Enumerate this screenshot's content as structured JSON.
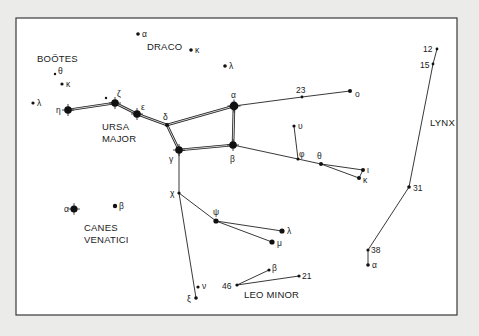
{
  "diagram": {
    "type": "star-chart",
    "frame": {
      "x": 16,
      "y": 18,
      "width": 441,
      "height": 297
    },
    "colors": {
      "background": "#ebebea",
      "panel": "#ffffff",
      "ink": "#111111"
    },
    "constellations": [
      {
        "id": "bootes",
        "label": "BOÖTES",
        "x": 37,
        "y": 62
      },
      {
        "id": "draco",
        "label": "DRACO",
        "x": 147,
        "y": 50
      },
      {
        "id": "ursa-major-1",
        "label": "URSA",
        "x": 102,
        "y": 130
      },
      {
        "id": "ursa-major-2",
        "label": "MAJOR",
        "x": 102,
        "y": 142
      },
      {
        "id": "lynx",
        "label": "LYNX",
        "x": 430,
        "y": 126
      },
      {
        "id": "canes-venatici-1",
        "label": "CANES",
        "x": 84,
        "y": 231
      },
      {
        "id": "canes-venatici-2",
        "label": "VENATICI",
        "x": 84,
        "y": 243
      },
      {
        "id": "leo-minor",
        "label": "LEO MINOR",
        "x": 244,
        "y": 298
      }
    ],
    "stars": [
      {
        "id": "dra-alpha",
        "label": "α",
        "x": 138,
        "y": 34,
        "r": 1.8,
        "lx": 142,
        "ly": 37
      },
      {
        "id": "dra-kappa",
        "label": "κ",
        "x": 191,
        "y": 50,
        "r": 1.8,
        "lx": 195,
        "ly": 53
      },
      {
        "id": "dra-lambda",
        "label": "λ",
        "x": 225,
        "y": 66,
        "r": 1.8,
        "lx": 229,
        "ly": 69
      },
      {
        "id": "boo-theta",
        "label": "θ",
        "x": 55,
        "y": 74,
        "r": 1.2,
        "lx": 58,
        "ly": 74
      },
      {
        "id": "boo-kappa",
        "label": "κ",
        "x": 62,
        "y": 84,
        "r": 1.6,
        "lx": 66,
        "ly": 87
      },
      {
        "id": "boo-lambda",
        "label": "λ",
        "x": 33,
        "y": 103,
        "r": 1.6,
        "lx": 37,
        "ly": 106
      },
      {
        "id": "uma-eta",
        "label": "η",
        "x": 68,
        "y": 110,
        "r": 3.8,
        "lx": 56,
        "ly": 113
      },
      {
        "id": "uma-80",
        "label": "",
        "x": 106,
        "y": 98,
        "r": 1.2,
        "lx": 0,
        "ly": 0
      },
      {
        "id": "uma-zeta",
        "label": "ζ",
        "x": 115,
        "y": 103,
        "r": 3.8,
        "lx": 117,
        "ly": 97
      },
      {
        "id": "uma-epsilon",
        "label": "ε",
        "x": 137,
        "y": 114,
        "r": 3.8,
        "lx": 141,
        "ly": 110
      },
      {
        "id": "uma-delta",
        "label": "δ",
        "x": 167,
        "y": 125,
        "r": 2.0,
        "lx": 163,
        "ly": 120
      },
      {
        "id": "uma-alpha",
        "label": "α",
        "x": 234,
        "y": 106,
        "r": 4.4,
        "lx": 231,
        "ly": 98
      },
      {
        "id": "uma-beta",
        "label": "β",
        "x": 233,
        "y": 145,
        "r": 3.8,
        "lx": 230,
        "ly": 162
      },
      {
        "id": "uma-gamma",
        "label": "γ",
        "x": 179,
        "y": 150,
        "r": 3.8,
        "lx": 169,
        "ly": 162
      },
      {
        "id": "uma-23",
        "label": "23",
        "x": 302,
        "y": 97,
        "r": 1.4,
        "lx": 296,
        "ly": 93
      },
      {
        "id": "uma-omicron",
        "label": "ο",
        "x": 350,
        "y": 91,
        "r": 2.0,
        "lx": 355,
        "ly": 97
      },
      {
        "id": "uma-upsilon",
        "label": "υ",
        "x": 294,
        "y": 126,
        "r": 1.6,
        "lx": 298,
        "ly": 129
      },
      {
        "id": "uma-phi",
        "label": "φ",
        "x": 298,
        "y": 159,
        "r": 1.6,
        "lx": 299,
        "ly": 157
      },
      {
        "id": "uma-theta",
        "label": "θ",
        "x": 321,
        "y": 164,
        "r": 2.0,
        "lx": 317,
        "ly": 159
      },
      {
        "id": "uma-iota",
        "label": "ι",
        "x": 363,
        "y": 170,
        "r": 2.0,
        "lx": 367,
        "ly": 173
      },
      {
        "id": "uma-kappa",
        "label": "κ",
        "x": 359,
        "y": 178,
        "r": 2.0,
        "lx": 363,
        "ly": 183
      },
      {
        "id": "uma-chi",
        "label": "χ",
        "x": 179,
        "y": 193,
        "r": 1.6,
        "lx": 170,
        "ly": 196
      },
      {
        "id": "uma-psi",
        "label": "ψ",
        "x": 216,
        "y": 221,
        "r": 2.6,
        "lx": 213,
        "ly": 215
      },
      {
        "id": "uma-lambda",
        "label": "λ",
        "x": 282,
        "y": 231,
        "r": 2.6,
        "lx": 287,
        "ly": 234
      },
      {
        "id": "uma-mu",
        "label": "μ",
        "x": 272,
        "y": 242,
        "r": 2.6,
        "lx": 277,
        "ly": 246
      },
      {
        "id": "uma-nu",
        "label": "ν",
        "x": 198,
        "y": 287,
        "r": 1.6,
        "lx": 202,
        "ly": 289
      },
      {
        "id": "uma-xi",
        "label": "ξ",
        "x": 196,
        "y": 298,
        "r": 1.8,
        "lx": 187,
        "ly": 302
      },
      {
        "id": "cvn-alpha",
        "label": "α",
        "x": 74,
        "y": 209,
        "r": 3.6,
        "lx": 64,
        "ly": 212
      },
      {
        "id": "cvn-beta",
        "label": "β",
        "x": 115,
        "y": 206,
        "r": 2.2,
        "lx": 119,
        "ly": 209
      },
      {
        "id": "lmi-46",
        "label": "46",
        "x": 237,
        "y": 285,
        "r": 1.6,
        "lx": 222,
        "ly": 289
      },
      {
        "id": "lmi-beta",
        "label": "β",
        "x": 269,
        "y": 270,
        "r": 1.6,
        "lx": 272,
        "ly": 271
      },
      {
        "id": "lmi-21",
        "label": "21",
        "x": 299,
        "y": 276,
        "r": 1.6,
        "lx": 302,
        "ly": 279
      },
      {
        "id": "lyn-12",
        "label": "12",
        "x": 437,
        "y": 49,
        "r": 1.4,
        "lx": 423,
        "ly": 52
      },
      {
        "id": "lyn-15",
        "label": "15",
        "x": 433,
        "y": 64,
        "r": 1.4,
        "lx": 420,
        "ly": 68
      },
      {
        "id": "lyn-31",
        "label": "31",
        "x": 409,
        "y": 187,
        "r": 1.8,
        "lx": 413,
        "ly": 191
      },
      {
        "id": "lyn-38",
        "label": "38",
        "x": 368,
        "y": 250,
        "r": 1.6,
        "lx": 371,
        "ly": 253
      },
      {
        "id": "lyn-alpha",
        "label": "α",
        "x": 368,
        "y": 265,
        "r": 1.8,
        "lx": 372,
        "ly": 268
      }
    ],
    "double_lines": [
      [
        "uma-eta",
        "uma-zeta"
      ],
      [
        "uma-zeta",
        "uma-epsilon"
      ],
      [
        "uma-epsilon",
        "uma-delta"
      ],
      [
        "uma-delta",
        "uma-alpha"
      ],
      [
        "uma-alpha",
        "uma-beta"
      ],
      [
        "uma-beta",
        "uma-gamma"
      ],
      [
        "uma-gamma",
        "uma-delta"
      ]
    ],
    "lines": [
      [
        "uma-alpha",
        "uma-23"
      ],
      [
        "uma-23",
        "uma-omicron"
      ],
      [
        "uma-beta",
        "uma-phi"
      ],
      [
        "uma-phi",
        "uma-theta"
      ],
      [
        "uma-theta",
        "uma-iota"
      ],
      [
        "uma-theta",
        "uma-kappa"
      ],
      [
        "uma-iota",
        "uma-kappa"
      ],
      [
        "uma-upsilon",
        "uma-phi"
      ],
      [
        "uma-gamma",
        "uma-chi"
      ],
      [
        "uma-chi",
        "uma-xi"
      ],
      [
        "uma-chi",
        "uma-psi"
      ],
      [
        "uma-psi",
        "uma-lambda"
      ],
      [
        "uma-psi",
        "uma-mu"
      ],
      [
        "lmi-46",
        "lmi-beta"
      ],
      [
        "lmi-46",
        "lmi-21"
      ],
      [
        "lyn-12",
        "lyn-15"
      ],
      [
        "lyn-15",
        "lyn-31"
      ],
      [
        "lyn-31",
        "lyn-38"
      ],
      [
        "lyn-38",
        "lyn-alpha"
      ]
    ]
  }
}
